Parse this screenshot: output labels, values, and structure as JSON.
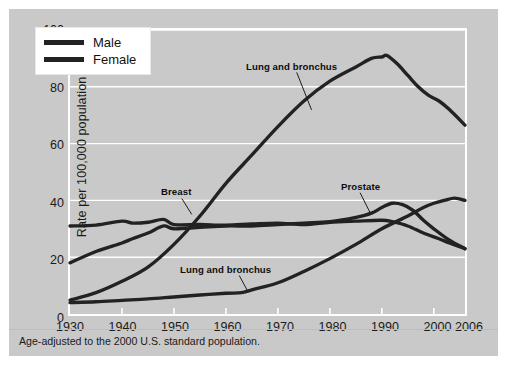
{
  "figure": {
    "background_color": "#c9c9c9",
    "plot_border_color": "#ffffff",
    "line_color": "#222222",
    "footnote": "Age-adjusted to the 2000 U.S. standard population."
  },
  "legend": {
    "position": "top-left-inside",
    "items": [
      {
        "label": "Male",
        "color": "#222222"
      },
      {
        "label": "Female",
        "color": "#222222"
      }
    ]
  },
  "annotations": [
    {
      "name": "male-lung-label",
      "text": "Lung and bronchus",
      "x_px": 237,
      "y_px": 52
    },
    {
      "name": "breast-label",
      "text": "Breast",
      "x_px": 152,
      "y_px": 177
    },
    {
      "name": "prostate-label",
      "text": "Prostate",
      "x_px": 332,
      "y_px": 172
    },
    {
      "name": "female-lung-label",
      "text": "Lung and bronchus",
      "x_px": 171,
      "y_px": 255
    }
  ],
  "chart_data": {
    "type": "line",
    "title": "",
    "subtitle": "",
    "xlabel": "",
    "ylabel": "Rate per 100,000 population",
    "xlim": [
      1930,
      2006
    ],
    "ylim": [
      0,
      100
    ],
    "xticks": [
      1930,
      1940,
      1950,
      1960,
      1970,
      1980,
      1990,
      2000,
      2006
    ],
    "yticks": [
      0,
      20,
      40,
      60,
      80,
      100
    ],
    "grid": "horizontal",
    "legend_position": "upper left",
    "note": "Age-adjusted to the 2000 U.S. standard population.",
    "series": [
      {
        "name": "Lung and bronchus",
        "sex": "Male",
        "label": "Lung and bronchus",
        "color": "#222222",
        "x": [
          1930,
          1935,
          1940,
          1945,
          1950,
          1955,
          1960,
          1965,
          1970,
          1975,
          1980,
          1985,
          1988,
          1990,
          1991,
          1993,
          1995,
          1997,
          1999,
          2001,
          2003,
          2006
        ],
        "values": [
          4.9,
          7.5,
          11.5,
          16.5,
          24.5,
          34.5,
          46,
          56,
          66,
          75,
          82,
          87,
          90,
          90.5,
          91,
          88,
          84,
          80,
          77,
          75,
          72,
          66.5
        ]
      },
      {
        "name": "Prostate",
        "sex": "Male",
        "label": "Prostate",
        "color": "#222222",
        "x": [
          1930,
          1935,
          1940,
          1942,
          1945,
          1948,
          1950,
          1955,
          1960,
          1965,
          1970,
          1975,
          1980,
          1985,
          1988,
          1990,
          1992,
          1994,
          1996,
          1998,
          2000,
          2003,
          2006
        ],
        "values": [
          18,
          22,
          25,
          26.5,
          28.5,
          31,
          30,
          30.5,
          31,
          31,
          31.5,
          32,
          32.5,
          34,
          35.5,
          37.5,
          39,
          38.5,
          36.5,
          33,
          30,
          26,
          23
        ]
      },
      {
        "name": "Breast",
        "sex": "Female",
        "label": "Breast",
        "color": "#222222",
        "x": [
          1930,
          1935,
          1940,
          1942,
          1945,
          1948,
          1950,
          1955,
          1960,
          1965,
          1970,
          1975,
          1980,
          1985,
          1990,
          1992,
          1995,
          1998,
          2001,
          2003,
          2006
        ],
        "values": [
          31,
          31.3,
          32.7,
          32,
          32.3,
          33.3,
          31.5,
          31.5,
          31.3,
          31.7,
          32,
          31.5,
          32.3,
          32.7,
          33,
          32.5,
          31,
          28.5,
          26.5,
          25,
          23
        ]
      },
      {
        "name": "Lung and bronchus",
        "sex": "Female",
        "label": "Lung and bronchus",
        "color": "#222222",
        "x": [
          1930,
          1935,
          1940,
          1945,
          1950,
          1955,
          1960,
          1963,
          1965,
          1970,
          1975,
          1980,
          1985,
          1990,
          1995,
          1998,
          2000,
          2002,
          2004,
          2006
        ],
        "values": [
          4,
          4.3,
          4.8,
          5.3,
          6,
          6.7,
          7.3,
          7.5,
          8.5,
          11,
          15,
          19.5,
          24.5,
          30,
          34.5,
          37.5,
          39,
          40,
          40.8,
          40
        ]
      }
    ]
  }
}
